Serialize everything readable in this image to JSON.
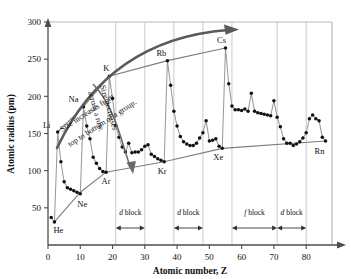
{
  "chart_data": {
    "type": "line",
    "title": "",
    "xlabel": "Atomic number, Z",
    "ylabel": "Atomic radius (pm)",
    "xlim": [
      0,
      88
    ],
    "ylim": [
      0,
      300
    ],
    "xticks": [
      0,
      10,
      20,
      30,
      40,
      50,
      60,
      70,
      80
    ],
    "yticks": [
      50,
      100,
      150,
      200,
      250,
      300
    ],
    "grid": "vertical-block-boundaries-only",
    "legend": "none",
    "series": [
      {
        "name": "Atomic radius",
        "x": [
          1,
          2,
          3,
          4,
          5,
          6,
          7,
          8,
          9,
          10,
          11,
          12,
          13,
          14,
          15,
          16,
          17,
          18,
          19,
          20,
          21,
          22,
          23,
          24,
          25,
          26,
          27,
          28,
          29,
          30,
          31,
          32,
          33,
          34,
          35,
          36,
          37,
          38,
          39,
          40,
          41,
          42,
          43,
          44,
          45,
          46,
          47,
          48,
          49,
          50,
          51,
          52,
          53,
          54,
          55,
          56,
          57,
          58,
          59,
          60,
          61,
          62,
          63,
          64,
          65,
          66,
          67,
          68,
          69,
          70,
          71,
          72,
          73,
          74,
          75,
          76,
          77,
          78,
          79,
          80,
          81,
          82,
          83,
          84,
          85,
          86
        ],
        "values": [
          37,
          31,
          152,
          112,
          85,
          77,
          75,
          73,
          71,
          69,
          186,
          160,
          143,
          118,
          110,
          103,
          99,
          98,
          227,
          197,
          161,
          145,
          132,
          125,
          137,
          124,
          125,
          125,
          128,
          133,
          135,
          122,
          119,
          116,
          114,
          112,
          248,
          215,
          180,
          160,
          146,
          139,
          136,
          134,
          134,
          137,
          144,
          151,
          167,
          140,
          141,
          143,
          133,
          130,
          265,
          217,
          187,
          182,
          182,
          181,
          183,
          180,
          204,
          180,
          178,
          177,
          176,
          175,
          174,
          194,
          172,
          159,
          143,
          137,
          137,
          134,
          136,
          139,
          144,
          151,
          170,
          175,
          170,
          167,
          145,
          140
        ]
      },
      {
        "name": "Alkali metal trend line",
        "x": [
          3,
          11,
          19,
          37,
          55
        ],
        "values": [
          152,
          186,
          227,
          248,
          265
        ]
      },
      {
        "name": "Noble gas trend line",
        "x": [
          2,
          10,
          18,
          36,
          54,
          86
        ],
        "values": [
          31,
          71,
          98,
          112,
          130,
          140
        ]
      }
    ],
    "point_labels": [
      {
        "element": "H",
        "z": 1,
        "radius": 37,
        "show": false
      },
      {
        "element": "He",
        "z": 2,
        "radius": 31,
        "show": true,
        "dx": 4,
        "dy": 11
      },
      {
        "element": "Li",
        "z": 3,
        "radius": 152,
        "show": true,
        "dx": -11,
        "dy": -4
      },
      {
        "element": "Ne",
        "z": 10,
        "radius": 69,
        "show": true,
        "dx": 2,
        "dy": 13
      },
      {
        "element": "Na",
        "z": 11,
        "radius": 186,
        "show": true,
        "dx": -10,
        "dy": -5
      },
      {
        "element": "Ar",
        "z": 18,
        "radius": 98,
        "show": true,
        "dx": 0,
        "dy": 12
      },
      {
        "element": "K",
        "z": 19,
        "radius": 227,
        "show": true,
        "dx": -3,
        "dy": -5
      },
      {
        "element": "Kr",
        "z": 36,
        "radius": 112,
        "show": true,
        "dx": -2,
        "dy": 12
      },
      {
        "element": "Rb",
        "z": 37,
        "radius": 248,
        "show": true,
        "dx": -6,
        "dy": -5
      },
      {
        "element": "Xe",
        "z": 54,
        "radius": 130,
        "show": true,
        "dx": -4,
        "dy": 12
      },
      {
        "element": "Cs",
        "z": 55,
        "radius": 265,
        "show": true,
        "dx": -4,
        "dy": -5
      },
      {
        "element": "Rn",
        "z": 86,
        "radius": 140,
        "show": true,
        "dx": -6,
        "dy": 13
      }
    ],
    "annotations": [
      {
        "id": "group-trend",
        "text_line1": "Size increases from",
        "text_line2": "top to bottom of a group.",
        "arrow": "curved-up-right"
      },
      {
        "id": "row-trend",
        "text_line1": "Size decreases",
        "text_line2": "across a row.",
        "arrow": "curved-down-right"
      }
    ],
    "blocks": [
      {
        "label_italic": "d",
        "label_rest": " block",
        "start": 21,
        "end": 30
      },
      {
        "label_italic": "d",
        "label_rest": " block",
        "start": 39,
        "end": 48
      },
      {
        "label_italic": "f",
        "label_rest": " block",
        "start": 57,
        "end": 71
      },
      {
        "label_italic": "d",
        "label_rest": " block",
        "start": 71,
        "end": 80
      }
    ]
  },
  "axes": {
    "x_title": "Atomic number, Z",
    "y_title": "Atomic radius (pm)",
    "x_tick_labels": [
      "0",
      "10",
      "20",
      "30",
      "40",
      "50",
      "60",
      "70",
      "80"
    ],
    "y_tick_labels": [
      "50",
      "100",
      "150",
      "200",
      "250",
      "300"
    ]
  },
  "colors": {
    "background": "#ffffff",
    "axis": "#4d4d4d",
    "data_line": "#8c8c8c",
    "data_point": "#111111",
    "frame": "#b3b3b3",
    "annotation_arrow": "#555555",
    "gridline": "#bdbdbd",
    "text": "#111111"
  }
}
